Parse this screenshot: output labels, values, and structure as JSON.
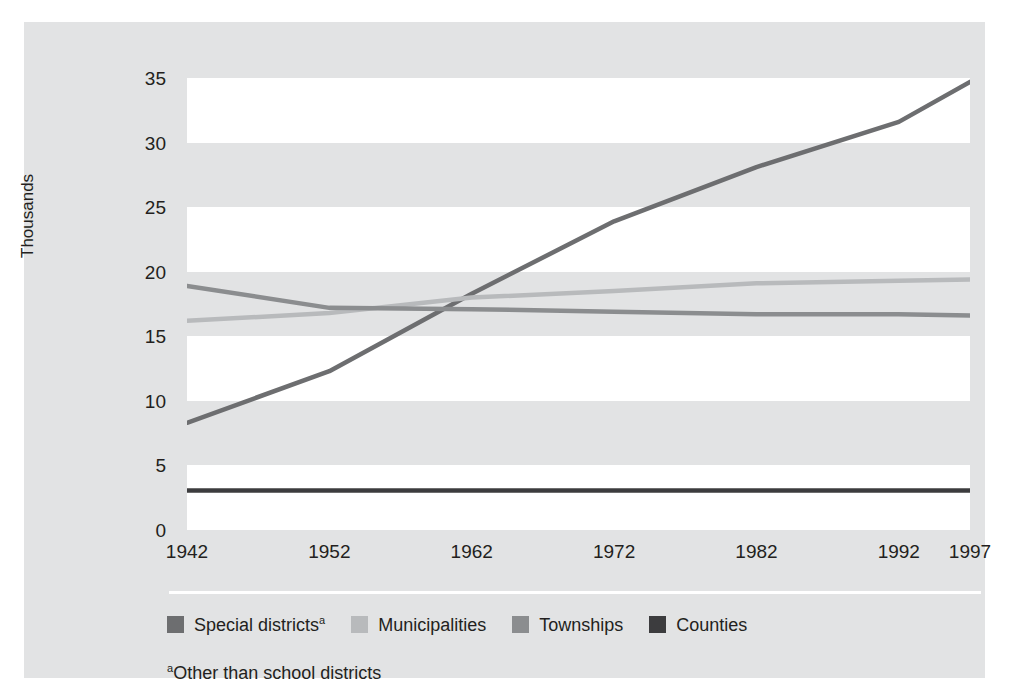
{
  "chart_data": {
    "type": "line",
    "title": "",
    "subtitle": "",
    "xlabel": "",
    "ylabel": "Thousands",
    "x": [
      1942,
      1952,
      1962,
      1972,
      1982,
      1992,
      1997
    ],
    "xtick_labels": [
      "1942",
      "1952",
      "1962",
      "1972",
      "1982",
      "1992",
      "1997"
    ],
    "ytick_labels": [
      "0",
      "5",
      "10",
      "15",
      "20",
      "25",
      "30",
      "35"
    ],
    "ytick_values": [
      0,
      5,
      10,
      15,
      20,
      25,
      30,
      35
    ],
    "xlim": [
      1942,
      1997
    ],
    "ylim": [
      0,
      35
    ],
    "grid": "alternating horizontal bands",
    "legend_position": "bottom",
    "series": [
      {
        "name": "Special districts",
        "name_suffix": "a",
        "color": "#6d6e70",
        "values": [
          8.3,
          12.3,
          18.3,
          23.9,
          28.1,
          31.6,
          34.7
        ]
      },
      {
        "name": "Municipalities",
        "name_suffix": "",
        "color": "#b8babc",
        "values": [
          16.2,
          16.8,
          18.0,
          18.5,
          19.1,
          19.3,
          19.4
        ]
      },
      {
        "name": "Townships",
        "name_suffix": "",
        "color": "#8b8d8f",
        "values": [
          18.9,
          17.2,
          17.1,
          16.9,
          16.7,
          16.7,
          16.6
        ]
      },
      {
        "name": "Counties",
        "name_suffix": "",
        "color": "#3c3c3e",
        "values": [
          3.05,
          3.05,
          3.05,
          3.05,
          3.05,
          3.05,
          3.05
        ]
      }
    ],
    "footnote": "Other than school districts",
    "footnote_marker": "a"
  },
  "colors": {
    "panel_background": "#e2e3e4",
    "band_light": "#ffffff",
    "band_dark": "#e2e3e4",
    "text": "#231f20",
    "rule": "#ffffff"
  },
  "legend": {
    "items": [
      {
        "label": "Special districts",
        "sup": "a",
        "color": "#6d6e70"
      },
      {
        "label": "Municipalities",
        "sup": "",
        "color": "#b8babc"
      },
      {
        "label": "Townships",
        "sup": "",
        "color": "#8b8d8f"
      },
      {
        "label": "Counties",
        "sup": "",
        "color": "#3c3c3e"
      }
    ]
  }
}
